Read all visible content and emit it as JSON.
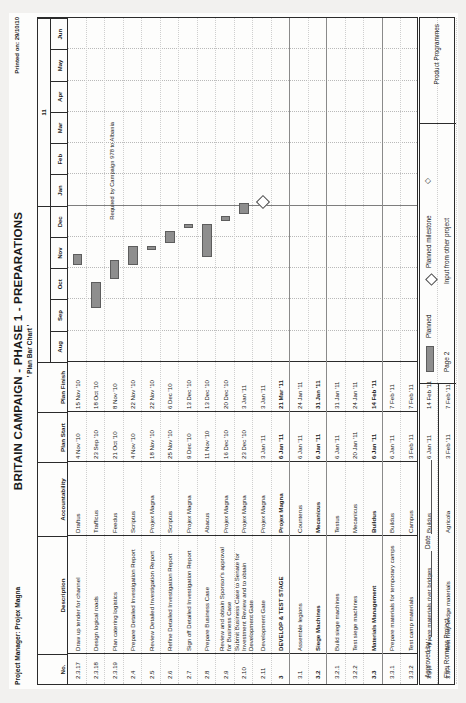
{
  "document": {
    "title": "BRITAIN CAMPAIGN - PHASE 1 - PREPARATIONS",
    "subtitle": "' Plan Bar Chart '",
    "project_manager": "Project Manager: Projex Magna",
    "printed_on": "Printed on: 29/10/10"
  },
  "columns": {
    "no": "No.",
    "description": "Description",
    "accountability": "Accountability",
    "plan_start": "Plan Start",
    "plan_finish": "Plan Finish"
  },
  "timeline": {
    "months": [
      "Aug",
      "Sep",
      "Oct",
      "Nov",
      "Dec",
      "Jan",
      "Feb",
      "Mar",
      "Apr",
      "May",
      "Jun"
    ],
    "year_labels": [
      "10",
      "11"
    ],
    "year_split_after_month_index": 4
  },
  "rows": [
    {
      "no": "2.3.17",
      "description": "Draw up tender for channel",
      "accountability": "Draftus",
      "plan_start": "4 Nov '10",
      "plan_finish": "15 Nov '10",
      "bold": false,
      "bar": {
        "start": 3.1,
        "end": 3.45
      }
    },
    {
      "no": "2.3.18",
      "description": "Design logical roads",
      "accountability": "Trafficus",
      "plan_start": "23 Sep '10",
      "plan_finish": "18 Oct '10",
      "bold": false,
      "bar": {
        "start": 1.72,
        "end": 2.55
      }
    },
    {
      "no": "2.3.19",
      "description": "Plan catering logistics",
      "accountability": "Feedus",
      "plan_start": "21 Oct '10",
      "plan_finish": "8 Nov '10",
      "bold": false,
      "bar": {
        "start": 2.65,
        "end": 3.25
      }
    },
    {
      "no": "2.4",
      "description": "Prepare Detailed Investigation Report",
      "accountability": "Scriptus",
      "plan_start": "4 Nov '10",
      "plan_finish": "22 Nov '10",
      "bold": false,
      "bar": {
        "start": 3.1,
        "end": 3.7
      }
    },
    {
      "no": "2.5",
      "description": "Review Detailed Investigation Report",
      "accountability": "Projex Magna",
      "plan_start": "18 Nov '10",
      "plan_finish": "22 Nov '10",
      "bold": false,
      "bar": {
        "start": 3.58,
        "end": 3.72
      }
    },
    {
      "no": "2.6",
      "description": "Refine Detailed Investigation Report",
      "accountability": "Scriptus",
      "plan_start": "25 Nov '10",
      "plan_finish": "6 Dec '10",
      "bold": false,
      "bar": {
        "start": 3.8,
        "end": 4.18
      }
    },
    {
      "no": "2.7",
      "description": "Sign off Detailed Investigation Report",
      "accountability": "Projex Magna",
      "plan_start": "9 Dec '10",
      "plan_finish": "13 Dec '10",
      "bold": false,
      "bar": {
        "start": 4.28,
        "end": 4.42
      }
    },
    {
      "no": "2.8",
      "description": "Prepare Business Case",
      "accountability": "Abacus",
      "plan_start": "11 Nov '10",
      "plan_finish": "13 Dec '10",
      "bold": false,
      "bar": {
        "start": 3.35,
        "end": 4.42
      }
    },
    {
      "no": "2.9",
      "description": "Review and obtain Sponsor's approval for Business Case",
      "accountability": "Projex Magna",
      "plan_start": "16 Dec '10",
      "plan_finish": "20 Dec '10",
      "bold": false,
      "bar": {
        "start": 4.52,
        "end": 4.66
      }
    },
    {
      "no": "2.10",
      "description": "Submit Business Case to Senate for Investment Review and to obtain Development Gate",
      "accountability": "Projex Magna",
      "plan_start": "23 Dec '10",
      "plan_finish": "3 Jan '11",
      "bold": false,
      "bar": {
        "start": 4.74,
        "end": 5.1
      }
    },
    {
      "no": "2.11",
      "description": "Development Gate",
      "accountability": "Projex Magna",
      "plan_start": "3 Jan '11",
      "plan_finish": "3 Jan '11",
      "bold": false,
      "milestone": 5.08
    },
    {
      "no": "3",
      "description": "DEVELOP & TEST STAGE",
      "accountability": "Projex Magna",
      "plan_start": "6 Jan '11",
      "plan_finish": "21 Mar '11",
      "bold": true
    },
    {
      "no": "3.1",
      "description": "Assemble legions",
      "accountability": "Counterus",
      "plan_start": "6 Jan '11",
      "plan_finish": "24 Jan '11",
      "bold": false
    },
    {
      "no": "3.2",
      "description": "Siege Machines",
      "accountability": "Mecanicus",
      "plan_start": "6 Jan '11",
      "plan_finish": "31 Jan '11",
      "bold": true
    },
    {
      "no": "3.2.1",
      "description": "Build siege machines",
      "accountability": "Testus",
      "plan_start": "6 Jan '11",
      "plan_finish": "31 Jan '11",
      "bold": false
    },
    {
      "no": "3.2.2",
      "description": "Test siege machines",
      "accountability": "Mecanicus",
      "plan_start": "20 Jan '11",
      "plan_finish": "24 Jan '11",
      "bold": false
    },
    {
      "no": "3.3",
      "description": "Materials Management",
      "accountability": "Buildus",
      "plan_start": "6 Jan '11",
      "plan_finish": "14 Feb '11",
      "bold": true
    },
    {
      "no": "3.3.1",
      "description": "Prepare materials for temporary camps",
      "accountability": "Buildus",
      "plan_start": "6 Jan '11",
      "plan_finish": "7 Feb '11",
      "bold": false
    },
    {
      "no": "3.3.2",
      "description": "Test camp materials",
      "accountability": "Campus",
      "plan_start": "3 Feb '11",
      "plan_finish": "7 Feb '11",
      "bold": false
    },
    {
      "no": "3.3.3",
      "description": "Prepare materials river bridges",
      "accountability": "Buildus",
      "plan_start": "6 Jan '11",
      "plan_finish": "14 Feb '11",
      "bold": false
    },
    {
      "no": "3.3.4",
      "description": "Test river bridge materials",
      "accountability": "Agricola",
      "plan_start": "3 Feb '11",
      "plan_finish": "7 Feb '11",
      "bold": false
    }
  ],
  "annotation": {
    "text": "Required by Campaign 978 to Albania"
  },
  "footer": {
    "approved_by": "Approved by :",
    "date": "Date",
    "file": "File: Romans Project",
    "legend_planned": "Planned",
    "legend_milestone": "Planned milestone",
    "legend_input": "Input from other project",
    "page": "Page 2",
    "programme": "Product Programmes"
  },
  "colors": {
    "bar_fill": "#8e8e8e",
    "bar_border": "#5d5d5d",
    "rule": "#2b2b2b",
    "paper": "#fdfdfc"
  }
}
